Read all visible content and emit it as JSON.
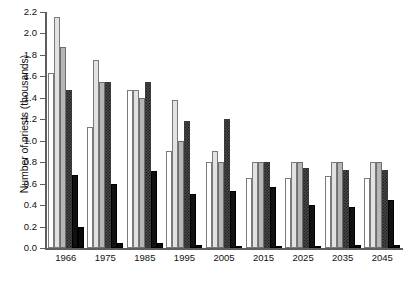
{
  "chart_data": {
    "type": "bar",
    "title": "",
    "xlabel": "",
    "ylabel": "Number of priests (thousands)",
    "ylim": [
      0.0,
      2.2
    ],
    "ytick_labels": [
      "0.0",
      "0.2",
      "0.4",
      "0.6",
      "0.8",
      "1.0",
      "1.2",
      "1.4",
      "1.6",
      "1.8",
      "2.0",
      "2.2"
    ],
    "ytick_values": [
      0.0,
      0.2,
      0.4,
      0.6,
      0.8,
      1.0,
      1.2,
      1.4,
      1.6,
      1.8,
      2.0,
      2.2
    ],
    "grid": false,
    "legend": "none",
    "categories": [
      "1966",
      "1975",
      "1985",
      "1995",
      "2005",
      "2015",
      "2025",
      "2035",
      "2045"
    ],
    "series": [
      {
        "name": "series-1",
        "fill": "white",
        "values": [
          1.63,
          1.13,
          1.47,
          0.9,
          0.8,
          0.65,
          0.65,
          0.67,
          0.65
        ]
      },
      {
        "name": "series-2",
        "fill": "light-gray",
        "values": [
          2.15,
          1.75,
          1.47,
          1.38,
          0.9,
          0.8,
          0.8,
          0.8,
          0.8
        ]
      },
      {
        "name": "series-3",
        "fill": "medium-gray",
        "values": [
          1.87,
          1.55,
          1.4,
          1.0,
          0.8,
          0.8,
          0.8,
          0.8,
          0.8
        ]
      },
      {
        "name": "series-4",
        "fill": "crosshatch",
        "values": [
          1.47,
          1.55,
          1.55,
          1.18,
          1.2,
          0.8,
          0.75,
          0.73,
          0.73
        ]
      },
      {
        "name": "series-5",
        "fill": "black",
        "values": [
          0.68,
          0.6,
          0.72,
          0.5,
          0.53,
          0.57,
          0.4,
          0.38,
          0.45
        ]
      },
      {
        "name": "series-6",
        "fill": "black-2",
        "values": [
          0.2,
          0.05,
          0.05,
          0.03,
          0.02,
          0.02,
          0.02,
          0.03,
          0.03
        ]
      }
    ]
  },
  "axis": {
    "y_title": "Number of priests (thousands)"
  }
}
